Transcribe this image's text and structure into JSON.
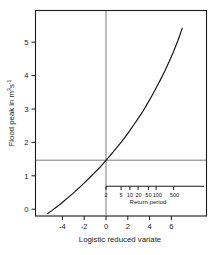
{
  "figure": {
    "background_color": "#ffffff",
    "foreground_color": "#1a1a1a",
    "curve_color": "#111111",
    "reference_line_color": "#5a5a5a"
  },
  "axes": {
    "x": {
      "label": "Logistic reduced variate",
      "ticks": [
        -4,
        -2,
        0,
        2,
        4,
        6
      ],
      "tick_labels": [
        "-4",
        "-2",
        "0",
        "2",
        "4",
        "6"
      ],
      "range": [
        -5.4,
        7.4
      ]
    },
    "y": {
      "label_parts": {
        "main": "Flood peak in m",
        "sup1": "3",
        "mid": "s",
        "sup2": "-1"
      },
      "label": "Flood peak in m3s-1",
      "ticks": [
        0,
        1,
        2,
        3,
        4,
        5
      ],
      "tick_labels": [
        "0",
        "1",
        "2",
        "3",
        "4",
        "5"
      ],
      "range": [
        -0.35,
        5.75
      ]
    }
  },
  "reference_lines": {
    "vertical_at_x": 0,
    "horizontal_at_y": 1.46
  },
  "inset": {
    "name": "return-period-axis",
    "label": "Return period",
    "tick_labels": [
      "2",
      "5",
      "10",
      "20",
      "50",
      "100",
      "500"
    ],
    "tick_variates": [
      0,
      1.386,
      2.197,
      2.944,
      3.892,
      4.595,
      6.213
    ]
  },
  "chart_data": {
    "type": "line",
    "title": "",
    "xlabel": "Logistic reduced variate",
    "ylabel": "Flood peak in m3s-1",
    "xlim": [
      -5.4,
      7.4
    ],
    "ylim": [
      -0.35,
      5.75
    ],
    "grid": false,
    "legend": null,
    "annotations": [
      {
        "type": "vline",
        "x": 0,
        "note": "return period = 2 years"
      },
      {
        "type": "hline",
        "y": 1.46,
        "note": "median flood peak"
      },
      {
        "type": "secondary-axis",
        "label": "Return period",
        "ticks": [
          2,
          5,
          10,
          20,
          50,
          100,
          500
        ]
      }
    ],
    "series": [
      {
        "name": "Flood frequency curve",
        "x": [
          -5.35,
          -5.0,
          -4.6,
          -4.2,
          -3.8,
          -3.4,
          -3.0,
          -2.6,
          -2.2,
          -1.8,
          -1.4,
          -1.0,
          -0.6,
          -0.2,
          0.0,
          0.2,
          0.6,
          1.0,
          1.4,
          1.8,
          2.2,
          2.6,
          3.0,
          3.4,
          3.8,
          4.2,
          4.6,
          5.0,
          5.4,
          5.8,
          6.2,
          6.6,
          7.0
        ],
        "y": [
          -0.13,
          -0.05,
          0.05,
          0.15,
          0.26,
          0.37,
          0.48,
          0.6,
          0.72,
          0.85,
          0.98,
          1.11,
          1.24,
          1.39,
          1.46,
          1.54,
          1.69,
          1.85,
          2.01,
          2.18,
          2.36,
          2.55,
          2.74,
          2.94,
          3.16,
          3.39,
          3.63,
          3.88,
          4.14,
          4.42,
          4.72,
          5.05,
          5.42
        ]
      }
    ]
  }
}
